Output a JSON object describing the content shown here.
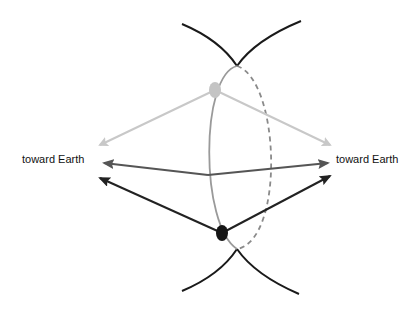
{
  "labels": {
    "left": "toward Earth",
    "right": "toward Earth"
  },
  "colors": {
    "background": "#ffffff",
    "cusp_curves": "#1a1a1a",
    "orbit_front": "#9a9a9a",
    "orbit_back_dashed": "#8a8a8a",
    "light_arrows": "#c8c8c8",
    "mid_arrows": "#555555",
    "dark_arrows": "#222222",
    "light_dot": "#c4c4c4",
    "dark_dot": "#151515"
  },
  "elements": {
    "light_dot": {
      "cx": 215,
      "cy": 90
    },
    "dark_dot": {
      "cx": 222,
      "cy": 233
    },
    "upper_cusp": {
      "x": 237,
      "y": 66
    },
    "lower_cusp": {
      "x": 237,
      "y": 249
    },
    "center_point": {
      "x": 208,
      "y": 175
    }
  }
}
